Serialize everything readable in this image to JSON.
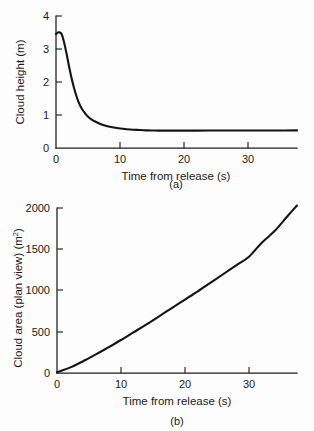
{
  "figure": {
    "background_color": "#fdfdfd",
    "ink_color": "#141414",
    "panels": [
      {
        "id": "a",
        "caption": "(a)",
        "xlabel": "Time from release (s)",
        "ylabel": "Cloud height (m)",
        "ylabel_unit": "",
        "x_ticks": [
          "0",
          "10",
          "20",
          "30"
        ],
        "y_ticks": [
          "0",
          "1",
          "2",
          "3",
          "4"
        ]
      },
      {
        "id": "b",
        "caption": "(b)",
        "xlabel": "Time from release (s)",
        "ylabel": "Cloud area (plan view) (m",
        "ylabel_unit": "2",
        "ylabel_tail": ")",
        "x_ticks": [
          "0",
          "10",
          "20",
          "30"
        ],
        "y_ticks": [
          "0",
          "500",
          "1000",
          "1500",
          "2000"
        ]
      }
    ]
  },
  "chart_data": [
    {
      "type": "line",
      "panel": "a",
      "title": "",
      "xlabel": "Time from release (s)",
      "ylabel": "Cloud height (m)",
      "xlim": [
        0,
        37.5
      ],
      "ylim": [
        0,
        4
      ],
      "xticks": [
        0,
        10,
        20,
        30
      ],
      "yticks": [
        0,
        1,
        2,
        3,
        4
      ],
      "grid": false,
      "legend": null,
      "x": [
        0,
        0.3,
        0.6,
        0.9,
        1.2,
        1.6,
        2,
        2.5,
        3,
        3.5,
        4,
        4.5,
        5,
        5.5,
        6,
        7,
        8,
        9,
        10,
        11,
        12,
        13,
        14,
        15,
        16,
        18,
        20,
        22,
        25,
        28,
        31,
        34,
        37.5
      ],
      "y": [
        3.45,
        3.5,
        3.5,
        3.44,
        3.25,
        2.9,
        2.5,
        2.05,
        1.68,
        1.4,
        1.2,
        1.06,
        0.95,
        0.87,
        0.81,
        0.72,
        0.66,
        0.62,
        0.59,
        0.57,
        0.555,
        0.545,
        0.535,
        0.53,
        0.528,
        0.527,
        0.527,
        0.528,
        0.529,
        0.53,
        0.531,
        0.532,
        0.533
      ]
    },
    {
      "type": "line",
      "panel": "b",
      "title": "",
      "xlabel": "Time from release (s)",
      "ylabel": "Cloud area (plan view) (m2)",
      "xlim": [
        0,
        37.5
      ],
      "ylim": [
        0,
        2000
      ],
      "xticks": [
        0,
        10,
        20,
        30
      ],
      "yticks": [
        0,
        500,
        1000,
        1500,
        2000
      ],
      "grid": false,
      "legend": null,
      "x": [
        0,
        1,
        2,
        3,
        4,
        5,
        6,
        8,
        10,
        12,
        14,
        16,
        18,
        20,
        22,
        24,
        26,
        28,
        30,
        32,
        34,
        36,
        37.5
      ],
      "y": [
        10,
        35,
        65,
        100,
        140,
        180,
        222,
        310,
        400,
        495,
        590,
        690,
        790,
        890,
        990,
        1095,
        1200,
        1305,
        1410,
        1580,
        1720,
        1900,
        2030
      ]
    }
  ]
}
